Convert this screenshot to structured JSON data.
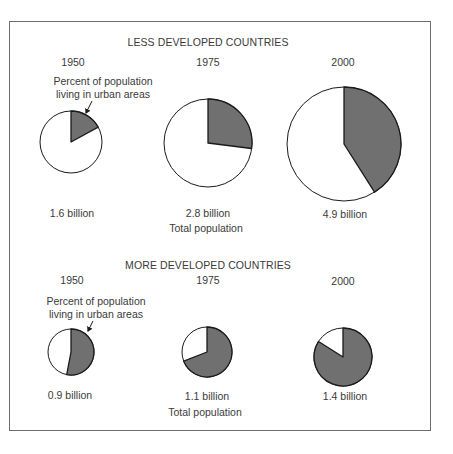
{
  "colors": {
    "urban": "#707070",
    "rural": "#ffffff",
    "stroke": "#1a1a1a",
    "frame": "#6e6e6e"
  },
  "chart_data": [
    {
      "type": "pie",
      "title": "LESS DEVELOPED COUNTRIES",
      "annotation": "Percent of population living in urban areas",
      "footer": "Total population",
      "categories": [
        "1950",
        "1975",
        "2000"
      ],
      "total_population_labels": [
        "1.6 billion",
        "2.8 billion",
        "4.9 billion"
      ],
      "total_population_billion": [
        1.6,
        2.8,
        4.9
      ],
      "series": [
        {
          "name": "Urban (%)",
          "values": [
            17,
            27,
            41
          ]
        },
        {
          "name": "Rural (%)",
          "values": [
            83,
            73,
            59
          ]
        }
      ]
    },
    {
      "type": "pie",
      "title": "MORE DEVELOPED COUNTRIES",
      "annotation": "Percent of population living in urban areas",
      "footer": "Total population",
      "categories": [
        "1950",
        "1975",
        "2000"
      ],
      "total_population_labels": [
        "0.9 billion",
        "1.1 billion",
        "1.4 billion"
      ],
      "total_population_billion": [
        0.9,
        1.1,
        1.4
      ],
      "series": [
        {
          "name": "Urban (%)",
          "values": [
            53,
            69,
            84
          ]
        },
        {
          "name": "Rural (%)",
          "values": [
            47,
            31,
            16
          ]
        }
      ]
    }
  ],
  "ldc": {
    "title": "LESS DEVELOPED COUNTRIES",
    "note_line1": "Percent of population",
    "note_line2": "living in urban areas",
    "footer": "Total population",
    "years": [
      "1950",
      "1975",
      "2000"
    ],
    "totals": [
      "1.6 billion",
      "2.8 billion",
      "4.9 billion"
    ]
  },
  "mdc": {
    "title": "MORE DEVELOPED COUNTRIES",
    "note_line1": "Percent of population",
    "note_line2": "living in urban areas",
    "footer": "Total population",
    "years": [
      "1950",
      "1975",
      "2000"
    ],
    "totals": [
      "0.9 billion",
      "1.1 billion",
      "1.4 billion"
    ]
  },
  "pie_geometry": [
    {
      "group": "ldc",
      "cx": 71,
      "cy": 142,
      "r": 31,
      "urban_pct": 17
    },
    {
      "group": "ldc",
      "cx": 208,
      "cy": 143,
      "r": 44,
      "urban_pct": 27
    },
    {
      "group": "ldc",
      "cx": 344,
      "cy": 144,
      "r": 57,
      "urban_pct": 41
    },
    {
      "group": "mdc",
      "cx": 71,
      "cy": 352,
      "r": 23,
      "urban_pct": 53
    },
    {
      "group": "mdc",
      "cx": 207,
      "cy": 352,
      "r": 25,
      "urban_pct": 69
    },
    {
      "group": "mdc",
      "cx": 343,
      "cy": 357,
      "r": 29,
      "urban_pct": 84
    }
  ]
}
